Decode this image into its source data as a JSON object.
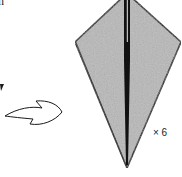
{
  "diagram": {
    "type": "origami-step",
    "top_left_text": "n",
    "repeat_label": "× 6",
    "arrow": "turn-over-arrow",
    "colors": {
      "paper": "#b8b8b8",
      "outline": "#1a1a1a",
      "center_fold": "#111111",
      "highlight": "#ffffff",
      "background": "#ffffff"
    }
  }
}
